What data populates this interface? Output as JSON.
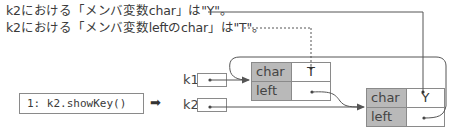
{
  "notes": {
    "line1": "k2における「メンバ変数char」は\"Y\"。",
    "line2": "k2における「メンバ変数leftのchar」は\"T\"。"
  },
  "code": {
    "line": "1: k2.showKey()",
    "arrow_glyph": "➡"
  },
  "variables": [
    {
      "name": "k1"
    },
    {
      "name": "k2"
    }
  ],
  "nodes": [
    {
      "id": "node-a",
      "fields": [
        {
          "name": "char",
          "value": "T"
        },
        {
          "name": "left",
          "value": ""
        }
      ]
    },
    {
      "id": "node-b",
      "fields": [
        {
          "name": "char",
          "value": "Y"
        },
        {
          "name": "left",
          "value": ""
        }
      ]
    }
  ],
  "colors": {
    "field_name_bg": "#b9b9b9",
    "border": "#8a8a8a",
    "wire": "#555555",
    "text": "#3a3a3a"
  }
}
